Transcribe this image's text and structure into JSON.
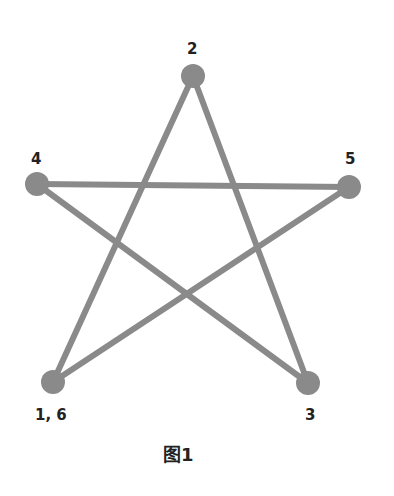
{
  "diagram": {
    "type": "graph",
    "line_color": "#8a8a8a",
    "node_color": "#8a8a8a",
    "nodes": [
      {
        "id": "2",
        "label": "2",
        "x": 193,
        "y": 76
      },
      {
        "id": "4",
        "label": "4",
        "x": 37,
        "y": 184
      },
      {
        "id": "5",
        "label": "5",
        "x": 349,
        "y": 187
      },
      {
        "id": "1_6",
        "label": "1, 6",
        "x": 53,
        "y": 382
      },
      {
        "id": "3",
        "label": "3",
        "x": 308,
        "y": 383
      }
    ],
    "edges": [
      {
        "from": "1_6",
        "to": "2"
      },
      {
        "from": "2",
        "to": "3"
      },
      {
        "from": "3",
        "to": "4"
      },
      {
        "from": "4",
        "to": "5"
      },
      {
        "from": "5",
        "to": "1_6"
      }
    ],
    "path_order": [
      "1",
      "2",
      "3",
      "4",
      "5",
      "6"
    ],
    "caption": "图1"
  }
}
